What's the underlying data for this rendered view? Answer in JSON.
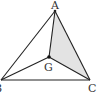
{
  "diagram": {
    "type": "triangle-centroid",
    "points": {
      "A": {
        "label": "A",
        "x": 55,
        "y": 11
      },
      "B": {
        "label": "B",
        "x": 1,
        "y": 80
      },
      "C": {
        "label": "C",
        "x": 90,
        "y": 80
      },
      "G": {
        "label": "G",
        "x": 49,
        "y": 57
      }
    },
    "shaded_region": [
      "A",
      "G",
      "C"
    ],
    "colors": {
      "stroke": "#222222",
      "shade": "#e3e3e3",
      "label": "#333333"
    }
  }
}
